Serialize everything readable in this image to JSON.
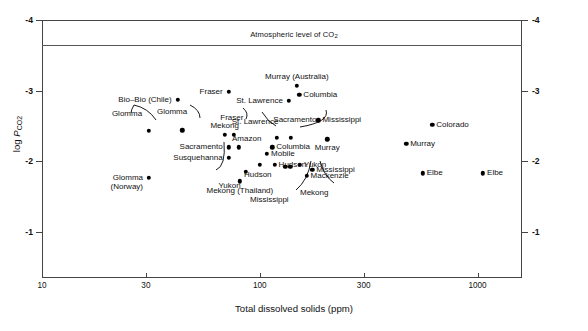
{
  "chart_data": {
    "type": "scatter",
    "title": "",
    "xlabel": "Total dissolved solids (ppm)",
    "ylabel": "log P_CO2",
    "xscale": "log",
    "xlim": [
      10,
      1600
    ],
    "ylim": [
      -4,
      -0.35
    ],
    "grid": false,
    "legend": null,
    "xticks": [
      {
        "value": 10,
        "label": "10"
      },
      {
        "value": 30,
        "label": "30"
      },
      {
        "value": 100,
        "label": "100"
      },
      {
        "value": 300,
        "label": "300"
      },
      {
        "value": 1000,
        "label": "1000"
      }
    ],
    "yticks": [
      {
        "value": -4,
        "label": "-4"
      },
      {
        "value": -3,
        "label": "-3"
      },
      {
        "value": -2,
        "label": "-2"
      },
      {
        "value": -1,
        "label": "-1"
      }
    ],
    "annotations": [
      {
        "name": "atmospheric-line",
        "text": "Atmospheric level of CO2",
        "y": -3.5,
        "type": "hline"
      }
    ],
    "points": [
      {
        "name": "Bio-Bio (Chile)",
        "x": 42,
        "y": -2.87,
        "label": "Bio–Bio (Chile)",
        "side": "right"
      },
      {
        "name": "Fraser-upper",
        "x": 72,
        "y": -2.98,
        "label": "Fraser",
        "side": "right"
      },
      {
        "name": "Glomma-a",
        "x": 31,
        "y": -2.43,
        "label": "Glomma",
        "side": "leader"
      },
      {
        "name": "Glomma-b",
        "x": 44,
        "y": -2.44,
        "label": "Glomma",
        "side": "leader"
      },
      {
        "name": "Mekong",
        "x": 69,
        "y": -2.38,
        "label": "Mekong",
        "side": "above"
      },
      {
        "name": "Fraser-lower",
        "x": 76,
        "y": -2.38,
        "label": "Fraser",
        "side": "leader"
      },
      {
        "name": "Sacramento-left",
        "x": 72,
        "y": -2.2,
        "label": "Sacramento",
        "side": "right"
      },
      {
        "name": "Amazon",
        "x": 80,
        "y": -2.2,
        "label": "Amazon",
        "side": "above"
      },
      {
        "name": "Susquehanna",
        "x": 72,
        "y": -2.05,
        "label": "Susquehanna",
        "side": "right"
      },
      {
        "name": "Murray (Australia)",
        "x": 148,
        "y": -3.07,
        "label": "Murray (Australia)",
        "side": "above"
      },
      {
        "name": "St. Lawrence-upper",
        "x": 136,
        "y": -2.86,
        "label": "St. Lawrence",
        "side": "right"
      },
      {
        "name": "Columbia-upper",
        "x": 152,
        "y": -2.94,
        "label": "Columbia",
        "side": "right-inline"
      },
      {
        "name": "St. Lawrence-lower",
        "x": 120,
        "y": -2.33,
        "label": "St. Lawrence",
        "side": "leader"
      },
      {
        "name": "Sacramento-right",
        "x": 139,
        "y": -2.33,
        "label": "Sacramento",
        "side": "leader"
      },
      {
        "name": "Mississippi-mid",
        "x": 186,
        "y": -2.58,
        "label": "Mississippi",
        "side": "right"
      },
      {
        "name": "Murray-mid",
        "x": 204,
        "y": -2.31,
        "label": "Murray",
        "side": "below"
      },
      {
        "name": "Columbia-lower",
        "x": 114,
        "y": -2.2,
        "label": "Columbia",
        "side": "right"
      },
      {
        "name": "Mobile",
        "x": 108,
        "y": -2.11,
        "label": "Mobile",
        "side": "right"
      },
      {
        "name": "Hudson-left",
        "x": 100,
        "y": -1.95,
        "label": "Hudson",
        "side": "below"
      },
      {
        "name": "Hudson-right",
        "x": 117,
        "y": -1.95,
        "label": "Hudson",
        "side": "right"
      },
      {
        "name": "Yukon-upper",
        "x": 153,
        "y": -1.95,
        "label": "Yukon",
        "side": "right"
      },
      {
        "name": "Mississippi-right",
        "x": 174,
        "y": -1.88,
        "label": "Mississippi",
        "side": "right"
      },
      {
        "name": "Mackenzie",
        "x": 164,
        "y": -1.8,
        "label": "Mackenzie",
        "side": "right"
      },
      {
        "name": "Mississippi-leader",
        "x": 131,
        "y": -1.92,
        "label": "Mississippi",
        "side": "leader"
      },
      {
        "name": "Mekong-leader",
        "x": 138,
        "y": -1.92,
        "label": "Mekong",
        "side": "leader"
      },
      {
        "name": "Yukon-lower",
        "x": 86,
        "y": -1.85,
        "label": "Yukon",
        "side": "leader"
      },
      {
        "name": "Mekong (Thailand)",
        "x": 81,
        "y": -1.72,
        "label": "Mekong (Thailand)",
        "side": "below"
      },
      {
        "name": "Glomma (Norway)",
        "x": 31,
        "y": -1.77,
        "label": "Glomma\n(Norway)",
        "side": "left"
      },
      {
        "name": "Colorado",
        "x": 620,
        "y": -2.52,
        "label": "Colorado",
        "side": "right"
      },
      {
        "name": "Murray-right",
        "x": 470,
        "y": -2.25,
        "label": "Murray",
        "side": "right"
      },
      {
        "name": "Elbe-left",
        "x": 560,
        "y": -1.83,
        "label": "Elbe",
        "side": "right"
      },
      {
        "name": "Elbe-right",
        "x": 1060,
        "y": -1.83,
        "label": "Elbe",
        "side": "right"
      }
    ]
  },
  "axes": {
    "x_title": "Total dissolved solids (ppm)",
    "y_title_prefix": "log ",
    "y_title_italic": "P",
    "y_title_sub": "CO",
    "y_title_sub2": "2",
    "x_tick_labels": [
      "10",
      "30",
      "100",
      "300",
      "1000"
    ],
    "y_tick_labels": [
      "-4",
      "-3",
      "-2",
      "-1"
    ]
  },
  "atmospheric": {
    "text_prefix": "Atmospheric level of CO",
    "text_sub": "2"
  }
}
